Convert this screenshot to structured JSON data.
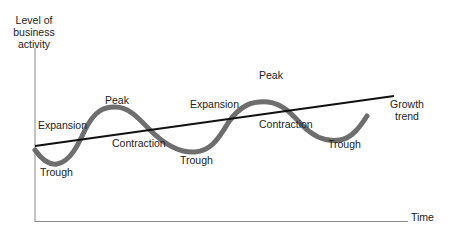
{
  "y_axis_label": [
    "Level of",
    "business",
    "activity"
  ],
  "x_axis_label": "Time",
  "trend_label": [
    "Growth",
    "trend"
  ],
  "phase_labels": {
    "expansion_1": "Expansion",
    "peak_1": "Peak",
    "contraction_1": "Contraction",
    "trough_0": "Trough",
    "trough_1": "Trough",
    "expansion_2": "Expansion",
    "peak_2": "Peak",
    "contraction_2": "Contraction",
    "trough_2": "Trough"
  },
  "colors": {
    "wave": "#6e6e6e",
    "trend": "#111111",
    "axes": "#888888",
    "text": "#222222"
  }
}
